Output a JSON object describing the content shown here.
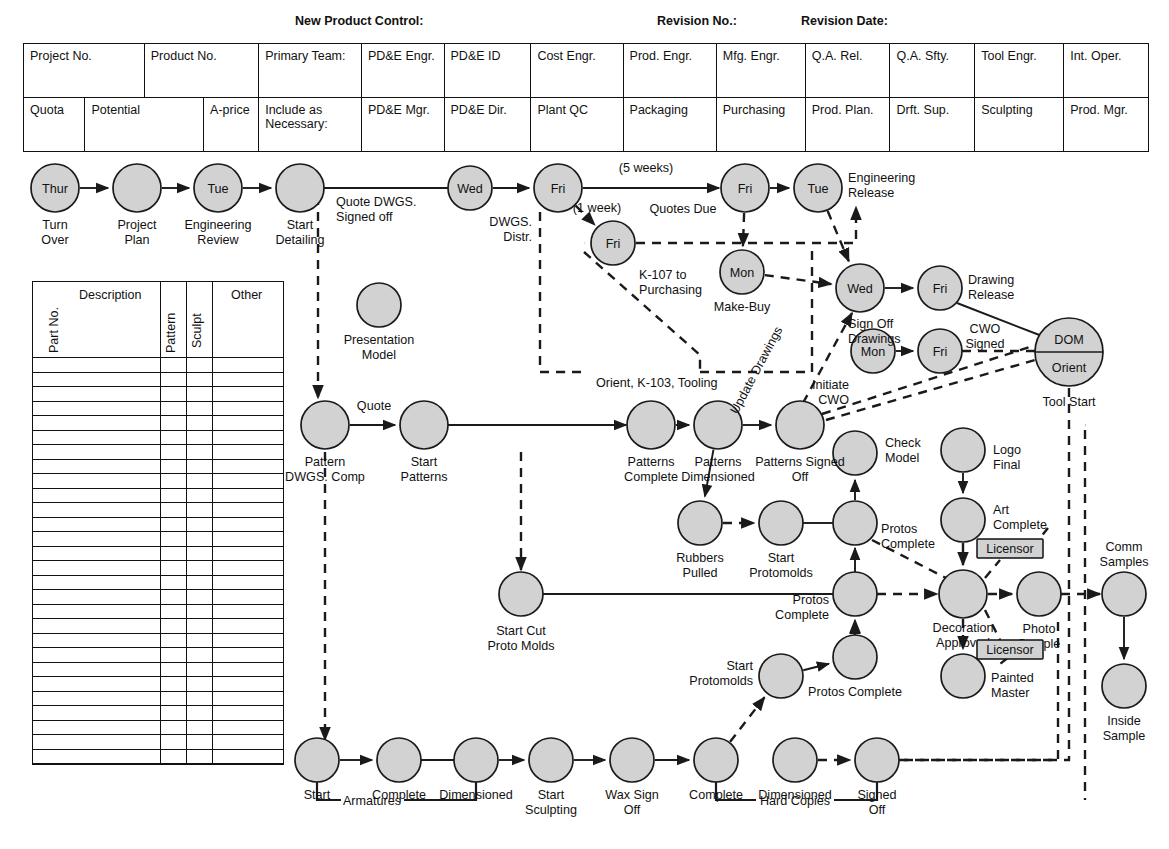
{
  "header_labels": [
    {
      "text": "New Product Control:",
      "x": 295
    },
    {
      "text": "Revision No.:",
      "x": 655
    },
    {
      "text": "Revision Date:",
      "x": 800
    }
  ],
  "header_table": {
    "row1": [
      "Project No.",
      "Product No.",
      "Primary Team:",
      "PD&E Engr.",
      "PD&E ID",
      "Cost Engr.",
      "Prod. Engr.",
      "Mfg. Engr.",
      "Q.A. Rel.",
      "Q.A. Sfty.",
      "Tool Engr.",
      "Int. Oper."
    ],
    "row2": [
      "Quota",
      "Potential",
      "A-price",
      "Include as Necessary:",
      "PD&E Mgr.",
      "PD&E Dir.",
      "Plant QC",
      "Packaging",
      "Purchasing",
      "Prod. Plan.",
      "Drft. Sup.",
      "Sculpting",
      "Prod. Mgr."
    ]
  },
  "parts_table": {
    "columns": [
      "Part No.",
      "Description",
      "Pattern",
      "Sculpt",
      "Other"
    ],
    "row_count": 28,
    "rows": []
  },
  "chart_data": {
    "type": "diagram",
    "legend": {
      "solid": "hard / committed path",
      "dashed": "information / approval path"
    },
    "nodes": [
      {
        "id": "turn_over",
        "day": "Thur",
        "label": "Turn Over",
        "x": 55,
        "y": 188,
        "r": 24
      },
      {
        "id": "project_plan",
        "day": "",
        "label": "Project Plan",
        "x": 137,
        "y": 188,
        "r": 24
      },
      {
        "id": "eng_review",
        "day": "Tue",
        "label": "Engineering Review",
        "x": 218,
        "y": 188,
        "r": 24
      },
      {
        "id": "start_detailing",
        "day": "",
        "label": "Start Detailing",
        "x": 300,
        "y": 188,
        "r": 24
      },
      {
        "id": "quote_dwgs",
        "day": "Wed",
        "label": "",
        "x": 470,
        "y": 188,
        "r": 22
      },
      {
        "id": "dwgs_distr",
        "day": "Fri",
        "label": "DWGS. Distr.",
        "x": 558,
        "y": 188,
        "r": 24
      },
      {
        "id": "k107",
        "day": "Fri",
        "label": "K-107 to Purchasing",
        "x": 613,
        "y": 243,
        "r": 22
      },
      {
        "id": "quotes_due",
        "day": "Fri",
        "label": "",
        "x": 745,
        "y": 188,
        "r": 24
      },
      {
        "id": "eng_release",
        "day": "Tue",
        "label": "Engineering Release",
        "x": 818,
        "y": 188,
        "r": 24
      },
      {
        "id": "make_buy",
        "day": "Mon",
        "label": "Make-Buy",
        "x": 742,
        "y": 272,
        "r": 22
      },
      {
        "id": "sign_off_dwgs",
        "day": "Wed",
        "label": "Sign Off Drawings",
        "x": 860,
        "y": 288,
        "r": 24
      },
      {
        "id": "drawing_release",
        "day": "Fri",
        "label": "Drawing Release",
        "x": 940,
        "y": 288,
        "r": 22
      },
      {
        "id": "initiate_cwo",
        "day": "Mon",
        "label": "Initiate CWO",
        "x": 873,
        "y": 351,
        "r": 22
      },
      {
        "id": "cwo_signed",
        "day": "Fri",
        "label": "",
        "x": 940,
        "y": 351,
        "r": 22
      },
      {
        "id": "dom_orient",
        "day": "DOM",
        "label": "Tool Start",
        "sublabel": "Orient",
        "x": 1069,
        "y": 352,
        "r": 34
      },
      {
        "id": "presentation_model",
        "day": "",
        "label": "Presentation Model",
        "x": 379,
        "y": 305,
        "r": 22
      },
      {
        "id": "pattern_dwgs",
        "day": "",
        "label": "Pattern DWGS. Comp",
        "x": 325,
        "y": 425,
        "r": 24
      },
      {
        "id": "start_patterns",
        "day": "",
        "label": "Start Patterns",
        "x": 424,
        "y": 425,
        "r": 24
      },
      {
        "id": "patterns_complete",
        "day": "",
        "label": "Patterns Complete",
        "x": 651,
        "y": 425,
        "r": 24
      },
      {
        "id": "patterns_dimensioned",
        "day": "",
        "label": "Patterns Dimensioned",
        "x": 718,
        "y": 425,
        "r": 24
      },
      {
        "id": "patterns_signed_off",
        "day": "",
        "label": "Patterns Signed Off",
        "x": 800,
        "y": 425,
        "r": 24
      },
      {
        "id": "check_model",
        "day": "",
        "label": "Check Model",
        "x": 855,
        "y": 453,
        "r": 22
      },
      {
        "id": "logo_final",
        "day": "",
        "label": "Logo Final",
        "x": 963,
        "y": 450,
        "r": 22
      },
      {
        "id": "art_complete",
        "day": "",
        "label": "Art Complete",
        "x": 963,
        "y": 520,
        "r": 22
      },
      {
        "id": "rubbers_pulled",
        "day": "",
        "label": "Rubbers Pulled",
        "x": 700,
        "y": 523,
        "r": 22
      },
      {
        "id": "start_protomolds_1",
        "day": "",
        "label": "Start Protomolds",
        "x": 781,
        "y": 523,
        "r": 22
      },
      {
        "id": "protos_complete_1",
        "day": "",
        "label": "Protos Complete",
        "x": 855,
        "y": 523,
        "r": 22
      },
      {
        "id": "start_cut_proto",
        "day": "",
        "label": "Start Cut Proto Molds",
        "x": 521,
        "y": 594,
        "r": 22
      },
      {
        "id": "protos_complete_2",
        "day": "",
        "label": "Protos Complete",
        "x": 855,
        "y": 594,
        "r": 22
      },
      {
        "id": "decoration_approved",
        "day": "",
        "label": "Decoration Approved",
        "x": 963,
        "y": 594,
        "r": 24
      },
      {
        "id": "photo_sample",
        "day": "",
        "label": "Photo Sample",
        "x": 1039,
        "y": 594,
        "r": 22
      },
      {
        "id": "comm_samples",
        "day": "",
        "label": "Comm Samples",
        "x": 1124,
        "y": 594,
        "r": 22
      },
      {
        "id": "inside_sample",
        "day": "",
        "label": "Inside Sample",
        "x": 1124,
        "y": 686,
        "r": 22
      },
      {
        "id": "painted_master",
        "day": "",
        "label": "Painted Master",
        "x": 963,
        "y": 676,
        "r": 22
      },
      {
        "id": "start_protomolds_2",
        "day": "",
        "label": "Start Protomolds",
        "x": 781,
        "y": 676,
        "r": 22
      },
      {
        "id": "protos_complete_3",
        "day": "",
        "label": "Protos Complete",
        "x": 855,
        "y": 657,
        "r": 22
      },
      {
        "id": "arm_start",
        "day": "",
        "label": "Start",
        "x": 317,
        "y": 760,
        "r": 22
      },
      {
        "id": "arm_complete",
        "day": "",
        "label": "Complete",
        "x": 399,
        "y": 760,
        "r": 22
      },
      {
        "id": "arm_dimensioned",
        "day": "",
        "label": "Dimensioned",
        "x": 476,
        "y": 760,
        "r": 22
      },
      {
        "id": "start_sculpting",
        "day": "",
        "label": "Start Sculpting",
        "x": 551,
        "y": 760,
        "r": 22
      },
      {
        "id": "wax_sign_off",
        "day": "",
        "label": "Wax Sign Off",
        "x": 632,
        "y": 760,
        "r": 22
      },
      {
        "id": "hc_complete",
        "day": "",
        "label": "Complete",
        "x": 716,
        "y": 760,
        "r": 22
      },
      {
        "id": "hc_dimensioned",
        "day": "",
        "label": "Dimensioned",
        "x": 795,
        "y": 760,
        "r": 22
      },
      {
        "id": "hc_signed_off",
        "day": "",
        "label": "Signed Off",
        "x": 877,
        "y": 760,
        "r": 22
      }
    ],
    "edge_labels": [
      {
        "text": "Quote DWGS. Signed off",
        "x": 350,
        "y": 204
      },
      {
        "text": "(5 weeks)",
        "x": 640,
        "y": 172
      },
      {
        "text": "Quotes Due",
        "x": 648,
        "y": 213
      },
      {
        "text": "(1 week)",
        "x": 580,
        "y": 214
      },
      {
        "text": "Orient, K-103, Tooling",
        "x": 595,
        "y": 383
      },
      {
        "text": "Update Drawings",
        "x": 760,
        "y": 370
      },
      {
        "text": "CWO Signed",
        "x": 985,
        "y": 330
      },
      {
        "text": "Quote",
        "x": 359,
        "y": 409
      },
      {
        "text": "Armatures",
        "x": 372,
        "y": 818
      },
      {
        "text": "Hard Copies",
        "x": 722,
        "y": 818
      },
      {
        "text": "Licensor",
        "x": 1010,
        "y": 549
      },
      {
        "text": "Licensor",
        "x": 1010,
        "y": 650
      }
    ]
  }
}
